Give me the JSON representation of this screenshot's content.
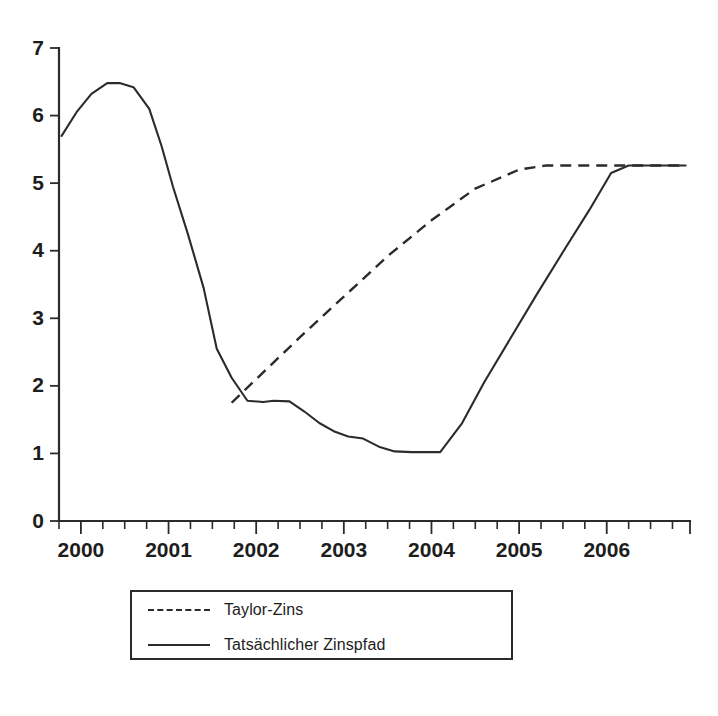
{
  "chart_data": {
    "type": "line",
    "title": "",
    "subtitle": "",
    "xlabel": "",
    "ylabel": "",
    "xlim": [
      1999.75,
      2006.95
    ],
    "ylim": [
      0,
      7
    ],
    "grid": false,
    "legend_position": "bottom-center",
    "y_ticks": [
      0,
      1,
      2,
      3,
      4,
      5,
      6,
      7
    ],
    "y_tick_labels": [
      "0",
      "1",
      "2",
      "3",
      "4",
      "5",
      "6",
      "7"
    ],
    "x_ticks": [
      2000,
      2001,
      2002,
      2003,
      2004,
      2005,
      2006
    ],
    "x_tick_labels": [
      "2000",
      "2001",
      "2002",
      "2003",
      "2004",
      "2005",
      "2006"
    ],
    "x_minor_tick_step": 0.25,
    "series": [
      {
        "name": "Taylor-Zins",
        "style": "dashed",
        "color": "#2b2b2b",
        "x": [
          2001.72,
          2002.0,
          2002.5,
          2003.0,
          2003.5,
          2004.0,
          2004.5,
          2005.0,
          2005.3,
          2005.75,
          2006.0,
          2006.5,
          2006.9
        ],
        "y": [
          1.75,
          2.1,
          2.72,
          3.32,
          3.92,
          4.45,
          4.92,
          5.2,
          5.26,
          5.26,
          5.26,
          5.26,
          5.26
        ]
      },
      {
        "name": "Tatsächlicher Zinspfad",
        "style": "solid",
        "color": "#2b2b2b",
        "x": [
          1999.78,
          1999.95,
          2000.12,
          2000.3,
          2000.45,
          2000.6,
          2000.78,
          2000.92,
          2001.05,
          2001.22,
          2001.4,
          2001.55,
          2001.72,
          2001.9,
          2002.08,
          2002.2,
          2002.38,
          2002.55,
          2002.72,
          2002.9,
          2003.05,
          2003.22,
          2003.4,
          2003.58,
          2003.78,
          2003.95,
          2004.1,
          2004.35,
          2004.6,
          2004.9,
          2005.2,
          2005.5,
          2005.8,
          2006.05,
          2006.25,
          2006.55,
          2006.9
        ],
        "y": [
          5.7,
          6.05,
          6.32,
          6.48,
          6.48,
          6.42,
          6.1,
          5.55,
          4.95,
          4.25,
          3.45,
          2.55,
          2.12,
          1.78,
          1.76,
          1.78,
          1.77,
          1.62,
          1.45,
          1.32,
          1.25,
          1.22,
          1.1,
          1.03,
          1.02,
          1.02,
          1.02,
          1.45,
          2.05,
          2.7,
          3.35,
          3.98,
          4.6,
          5.15,
          5.26,
          5.26,
          5.26
        ]
      }
    ]
  },
  "legend": {
    "items": [
      {
        "label": "Taylor-Zins",
        "style": "dashed"
      },
      {
        "label": "Tatsächlicher Zinspfad",
        "style": "solid"
      }
    ]
  },
  "source_note": {
    "text": ""
  }
}
